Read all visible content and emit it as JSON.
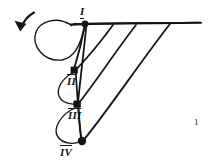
{
  "figure": {
    "kind": "hand-drawn-graph-diagram",
    "background_color": "#ffffff",
    "ink_color": "#141414",
    "canvas": {
      "width": 208,
      "height": 164
    },
    "corner_mark": "1",
    "nodes": [
      {
        "id": "I",
        "label": "I",
        "x": 85,
        "y": 24,
        "radius": 3.4,
        "label_x": 80,
        "label_y": 6,
        "label_position": "above"
      },
      {
        "id": "II",
        "label": "II",
        "x": 74,
        "y": 70,
        "radius": 3.6,
        "label_x": 67,
        "label_y": 74,
        "label_position": "below"
      },
      {
        "id": "III",
        "label": "III",
        "x": 77,
        "y": 104,
        "radius": 3.6,
        "label_x": 68,
        "label_y": 108,
        "label_position": "below"
      },
      {
        "id": "IV",
        "label": "IV",
        "x": 82,
        "y": 141,
        "radius": 4.0,
        "label_x": 60,
        "label_y": 145,
        "label_position": "below-left"
      }
    ],
    "baseline": {
      "name": "horizontal-top-line",
      "x1": 71,
      "y1": 24,
      "x2": 201,
      "y2": 23,
      "tick_points_x": [
        113,
        136,
        170
      ]
    },
    "straight_edges": [
      {
        "from": "I",
        "to": "II",
        "x1": 85,
        "y1": 25,
        "x2": 75,
        "y2": 68
      },
      {
        "from": "baseline1",
        "to": "II",
        "x1": 113,
        "y1": 25,
        "x2": 77,
        "y2": 69
      },
      {
        "from": "baseline2",
        "to": "III",
        "x1": 136,
        "y1": 25,
        "x2": 79,
        "y2": 102
      },
      {
        "from": "I",
        "to": "III",
        "x1": 86,
        "y1": 26,
        "x2": 78,
        "y2": 101
      },
      {
        "from": "baseline3",
        "to": "IV",
        "x1": 170,
        "y1": 24,
        "x2": 84,
        "y2": 139
      },
      {
        "from": "II",
        "to": "IV",
        "x1": 76,
        "y1": 72,
        "x2": 81,
        "y2": 139
      },
      {
        "from": "III",
        "to": "IV",
        "x1": 78,
        "y1": 107,
        "x2": 81,
        "y2": 139
      }
    ],
    "loop_arcs": [
      {
        "name": "arc-I-big-left-loop",
        "path": "M 85 27 C 78 52, 66 62, 52 56 C 34 48, 32 26, 52 21 C 62 19, 66 23, 68 26"
      },
      {
        "name": "arc-II-III-left-loop",
        "path": "M 73 73 C 63 80, 58 90, 62 97 C 66 103, 73 104, 76 103"
      },
      {
        "name": "arc-III-IV-left-loop",
        "path": "M 75 108 C 62 115, 54 128, 60 137 C 66 145, 76 144, 80 142"
      }
    ],
    "arrow": {
      "name": "rotation-arrow",
      "path": "M 33 13 C 27 16, 22 21, 20 29",
      "head": "M 20 31 L 15 21 L 26 24 Z",
      "direction": "down-left"
    }
  }
}
